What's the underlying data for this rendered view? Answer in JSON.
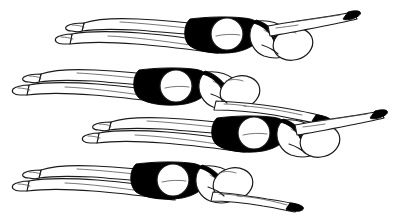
{
  "image": {
    "title": "Four swimmers in streamline position",
    "type": "line-drawing",
    "width": 407,
    "height": 217,
    "background_color": "#ffffff",
    "ink_color": "#1a1a1a",
    "suit_color": "#000000",
    "shading_color": "#4a4a4a",
    "subject_count": 4,
    "style": "black-and-white pen-and-ink illustration",
    "caption": ""
  },
  "figures": [
    {
      "index": 1,
      "label": "swimmer-1",
      "row": "top",
      "facing": "right",
      "body_y": 36,
      "feet_x": 66,
      "hand_x": 359,
      "cap_center_x": 293,
      "cap_center_y": 44,
      "cap_rx": 20,
      "cap_ry": 16,
      "suit_color": "#000000",
      "seat_center_x": 227,
      "seat_center_y": 34,
      "seat_r": 16
    },
    {
      "index": 2,
      "label": "swimmer-2",
      "row": "second",
      "facing": "right",
      "body_y": 86,
      "feet_x": 23,
      "hand_x": 330,
      "cap_center_x": 240,
      "cap_center_y": 92,
      "cap_rx": 20,
      "cap_ry": 16,
      "suit_color": "#000000",
      "seat_center_x": 176,
      "seat_center_y": 86,
      "seat_r": 16
    },
    {
      "index": 3,
      "label": "swimmer-3",
      "row": "third",
      "facing": "right",
      "body_y": 135,
      "feet_x": 93,
      "hand_x": 386,
      "cap_center_x": 320,
      "cap_center_y": 141,
      "cap_rx": 20,
      "cap_ry": 16,
      "suit_color": "#000000",
      "seat_center_x": 254,
      "seat_center_y": 133,
      "seat_r": 16
    },
    {
      "index": 4,
      "label": "swimmer-4",
      "row": "bottom",
      "facing": "right",
      "body_y": 182,
      "feet_x": 23,
      "hand_x": 301,
      "cap_center_x": 233,
      "cap_center_y": 184,
      "cap_rx": 20,
      "cap_ry": 16,
      "suit_color": "#000000",
      "seat_center_x": 173,
      "seat_center_y": 180,
      "seat_r": 16
    }
  ]
}
